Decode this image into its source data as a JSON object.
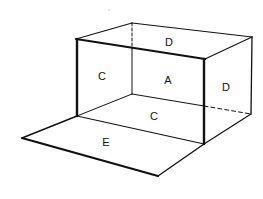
{
  "diagram": {
    "type": "open-box-perspective",
    "colors": {
      "line": "#111111",
      "background": "#ffffff",
      "speck": "#bbbbbb"
    },
    "labels": {
      "top": "D",
      "left_side": "C",
      "back_wall": "A",
      "right_side": "D",
      "floor": "C",
      "front_flap": "E"
    }
  }
}
